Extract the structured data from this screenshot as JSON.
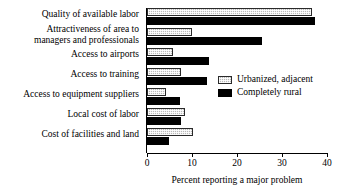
{
  "chart_data": {
    "type": "bar",
    "orientation": "horizontal",
    "title": "",
    "xlabel": "Percent reporting a major problem",
    "ylabel": "",
    "xlim": [
      0,
      40
    ],
    "xticks": [
      0,
      10,
      20,
      30,
      40
    ],
    "xtick_labels": [
      "0",
      "10",
      "20",
      "30",
      "40"
    ],
    "grid": false,
    "legend_position": "center-right",
    "categories": [
      "Quality of available labor",
      "Attractiveness of area to\nmanagers and professionals",
      "Access to airports",
      "Access to training",
      "Access to equipment suppliers",
      "Local cost of labor",
      "Cost of facilities and land"
    ],
    "series": [
      {
        "name": "Urbanized, adjacent",
        "color": "#b9b9b9",
        "values": [
          36.7,
          10.0,
          5.8,
          7.6,
          4.2,
          8.4,
          10.2
        ]
      },
      {
        "name": "Completely rural",
        "color": "#000000",
        "values": [
          37.3,
          25.6,
          13.8,
          13.3,
          7.3,
          7.6,
          4.9
        ]
      }
    ]
  },
  "legend": {
    "items": [
      {
        "label": "Urbanized, adjacent",
        "swatch": "gray"
      },
      {
        "label": "Completely rural",
        "swatch": "black"
      }
    ]
  }
}
